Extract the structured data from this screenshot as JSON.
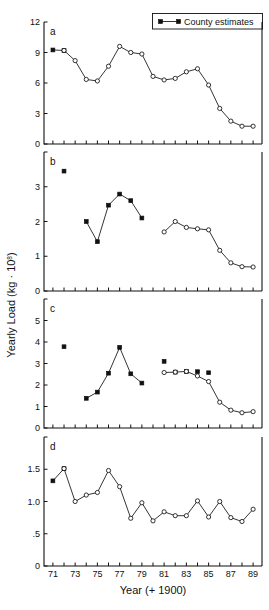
{
  "figure": {
    "y_axis_label_main": "Yearly Load (kg",
    "y_axis_label_mid": " · 10",
    "y_axis_label_sup": "8",
    "y_axis_label_end": ")",
    "x_axis_label": "Year (+ 1900)",
    "legend": {
      "label": "County estimates",
      "marker": "filled-square-with-line"
    },
    "panel_labels": [
      "a",
      "b",
      "c",
      "d"
    ]
  },
  "chart_data": [
    {
      "type": "line",
      "panel": "a",
      "title": "",
      "xlabel": "Year (+ 1900)",
      "ylabel": "Yearly Load (kg · 10^8)",
      "xlim": [
        70.2,
        89.8
      ],
      "ylim": [
        0,
        12
      ],
      "yticks": [
        0,
        3,
        6,
        9,
        12
      ],
      "ytick_labels": [
        "0",
        "3",
        "6",
        "9",
        "12"
      ],
      "xticks": [
        71,
        72,
        73,
        74,
        75,
        76,
        77,
        78,
        79,
        80,
        81,
        82,
        83,
        84,
        85,
        86,
        87,
        88,
        89
      ],
      "xtick_labels": [
        "71",
        "",
        "73",
        "",
        "75",
        "",
        "77",
        "",
        "79",
        "",
        "81",
        "",
        "83",
        "",
        "85",
        "",
        "87",
        "",
        "89"
      ],
      "grid": false,
      "legend_position": "top-right",
      "series": [
        {
          "name": "County estimates",
          "marker": "filled-square",
          "x": [
            71,
            72
          ],
          "values": [
            9.25,
            9.2
          ]
        },
        {
          "name": "Modeled estimates",
          "marker": "open-circle",
          "x": [
            72,
            73,
            74,
            75,
            76,
            77,
            78,
            79,
            80,
            81,
            82,
            83,
            84,
            85,
            86,
            87,
            88,
            89
          ],
          "values": [
            9.2,
            8.2,
            6.35,
            6.2,
            7.65,
            9.6,
            9.0,
            8.85,
            6.65,
            6.3,
            6.45,
            7.1,
            7.4,
            5.8,
            3.5,
            2.25,
            1.75,
            1.75
          ]
        }
      ]
    },
    {
      "type": "line",
      "panel": "b",
      "title": "",
      "xlabel": "Year (+ 1900)",
      "ylabel": "Yearly Load (kg · 10^8)",
      "xlim": [
        70.2,
        89.8
      ],
      "ylim": [
        0,
        4
      ],
      "yticks": [
        0,
        1,
        2,
        3,
        4
      ],
      "ytick_labels": [
        "0",
        "1",
        "2",
        "3",
        ""
      ],
      "xticks": [
        71,
        72,
        73,
        74,
        75,
        76,
        77,
        78,
        79,
        80,
        81,
        82,
        83,
        84,
        85,
        86,
        87,
        88,
        89
      ],
      "grid": false,
      "series": [
        {
          "name": "County estimates",
          "marker": "filled-square",
          "x": [
            72
          ],
          "values": [
            3.45
          ],
          "connected": false
        },
        {
          "name": "County estimates",
          "marker": "filled-square",
          "x": [
            74,
            75,
            76,
            77,
            78,
            79
          ],
          "values": [
            2.0,
            1.42,
            2.47,
            2.79,
            2.6,
            2.1
          ]
        },
        {
          "name": "Modeled estimates",
          "marker": "open-circle",
          "x": [
            81,
            82,
            83,
            84,
            85,
            86,
            87,
            88,
            89
          ],
          "values": [
            1.7,
            2.0,
            1.83,
            1.79,
            1.76,
            1.17,
            0.81,
            0.7,
            0.69
          ]
        }
      ]
    },
    {
      "type": "line",
      "panel": "c",
      "title": "",
      "xlabel": "Year (+ 1900)",
      "ylabel": "Yearly Load (kg · 10^8)",
      "xlim": [
        70.2,
        89.8
      ],
      "ylim": [
        0,
        6
      ],
      "yticks": [
        0,
        1,
        2,
        3,
        4,
        5,
        6
      ],
      "ytick_labels": [
        "0",
        "1",
        "2",
        "3",
        "4",
        "5",
        ""
      ],
      "xticks": [
        71,
        72,
        73,
        74,
        75,
        76,
        77,
        78,
        79,
        80,
        81,
        82,
        83,
        84,
        85,
        86,
        87,
        88,
        89
      ],
      "grid": false,
      "series": [
        {
          "name": "County estimates",
          "marker": "filled-square",
          "x": [
            72
          ],
          "values": [
            3.78
          ],
          "connected": false
        },
        {
          "name": "County estimates",
          "marker": "filled-square",
          "x": [
            74,
            75,
            76,
            77,
            78,
            79
          ],
          "values": [
            1.38,
            1.67,
            2.55,
            3.75,
            2.52,
            2.09
          ]
        },
        {
          "name": "County estimates",
          "marker": "filled-square",
          "x": [
            81
          ],
          "values": [
            3.1
          ],
          "connected": false
        },
        {
          "name": "County estimates",
          "marker": "filled-square",
          "x": [
            82,
            83,
            84,
            85
          ],
          "values": [
            2.6,
            2.63,
            2.62,
            2.57
          ],
          "connected": false
        },
        {
          "name": "Modeled estimates",
          "marker": "open-circle",
          "x": [
            81,
            82,
            83,
            84,
            85,
            86,
            87,
            88,
            89
          ],
          "values": [
            2.58,
            2.6,
            2.63,
            2.42,
            2.16,
            1.2,
            0.83,
            0.71,
            0.76
          ]
        }
      ]
    },
    {
      "type": "line",
      "panel": "d",
      "title": "",
      "xlabel": "Year (+ 1900)",
      "ylabel": "Yearly Load (kg · 10^8)",
      "xlim": [
        70.2,
        89.8
      ],
      "ylim": [
        0,
        2.0
      ],
      "yticks": [
        0,
        0.5,
        1.0,
        1.5,
        2.0
      ],
      "ytick_labels": [
        "0",
        ".5",
        "1.0",
        "1.5",
        ""
      ],
      "xticks": [
        71,
        72,
        73,
        74,
        75,
        76,
        77,
        78,
        79,
        80,
        81,
        82,
        83,
        84,
        85,
        86,
        87,
        88,
        89
      ],
      "xtick_labels": [
        "71",
        "",
        "73",
        "",
        "75",
        "",
        "77",
        "",
        "79",
        "",
        "81",
        "",
        "83",
        "",
        "85",
        "",
        "87",
        "",
        "89"
      ],
      "grid": false,
      "series": [
        {
          "name": "County estimates",
          "marker": "filled-square",
          "x": [
            71,
            72
          ],
          "values": [
            1.32,
            1.51
          ]
        },
        {
          "name": "Modeled estimates",
          "marker": "open-circle",
          "x": [
            72,
            73,
            74,
            75,
            76,
            77,
            78,
            79,
            80,
            81,
            82,
            83,
            84,
            85,
            86,
            87,
            88,
            89
          ],
          "values": [
            1.51,
            1.0,
            1.1,
            1.14,
            1.48,
            1.23,
            0.74,
            0.98,
            0.7,
            0.84,
            0.78,
            0.78,
            1.01,
            0.76,
            1.0,
            0.75,
            0.69,
            0.88
          ]
        }
      ]
    }
  ]
}
